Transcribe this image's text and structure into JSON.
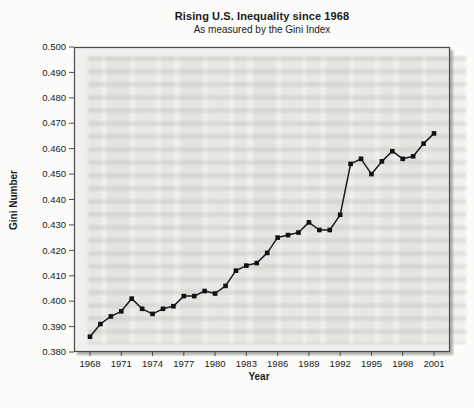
{
  "chart_data": {
    "type": "line",
    "title": "Rising U.S. Inequality since 1968",
    "subtitle": "As measured by the Gini Index",
    "xlabel": "Year",
    "ylabel": "Gini Number",
    "x": [
      1968,
      1969,
      1970,
      1971,
      1972,
      1973,
      1974,
      1975,
      1976,
      1977,
      1978,
      1979,
      1980,
      1981,
      1982,
      1983,
      1984,
      1985,
      1986,
      1987,
      1988,
      1989,
      1990,
      1991,
      1992,
      1993,
      1994,
      1995,
      1996,
      1997,
      1998,
      1999,
      2000,
      2001
    ],
    "values": [
      0.386,
      0.391,
      0.394,
      0.396,
      0.401,
      0.397,
      0.395,
      0.397,
      0.398,
      0.402,
      0.402,
      0.404,
      0.403,
      0.406,
      0.412,
      0.414,
      0.415,
      0.419,
      0.425,
      0.426,
      0.427,
      0.431,
      0.428,
      0.428,
      0.434,
      0.454,
      0.456,
      0.45,
      0.455,
      0.459,
      0.456,
      0.457,
      0.462,
      0.466
    ],
    "ylim": [
      0.38,
      0.5
    ],
    "ytick_step": 0.01,
    "ytick_format_decimals": 3,
    "xticks": [
      1968,
      1971,
      1974,
      1977,
      1980,
      1983,
      1986,
      1989,
      1992,
      1995,
      1998,
      2001
    ],
    "grid": false,
    "legend": "none",
    "marker": "square",
    "colors": {
      "line": "#1b1b1b",
      "marker": "#111111",
      "plot_bg": "#f1f0ee",
      "frame": "#4a4a4a",
      "shadow": "#b4b2ae",
      "text": "#1a1a1a",
      "page_bg": "#fcfcfa"
    }
  }
}
